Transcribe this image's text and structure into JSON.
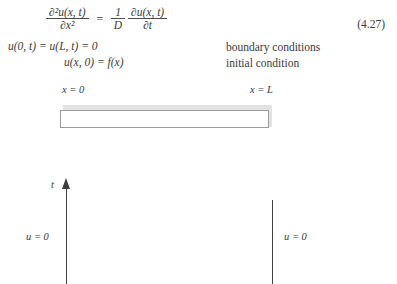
{
  "equation": {
    "number": "(4.27)",
    "pde": {
      "lhs_numerator": "∂²u(x, t)",
      "lhs_denominator": "∂x²",
      "equals": "=",
      "rhs_coeff_numerator": "1",
      "rhs_coeff_denominator": "D",
      "rhs_numerator": "∂u(x, t)",
      "rhs_denominator": "∂t"
    },
    "boundary_equation": "u(0, t) = u(L, t) = 0",
    "initial_equation": "u(x, 0) = f(x)",
    "boundary_label": "boundary conditions",
    "initial_label": "initial condition"
  },
  "rod_figure": {
    "left_label": "x = 0",
    "right_label": "x = L"
  },
  "domain_figure": {
    "axis_label": "t",
    "left_boundary_label": "u = 0",
    "right_boundary_label": "u = 0"
  },
  "colors": {
    "text": "#3a3a3a",
    "rule": "#4a4a4a",
    "rod_border": "#9b9b9b",
    "rod_shadow": "#e2e2e2",
    "axis": "#3f3f3f"
  }
}
